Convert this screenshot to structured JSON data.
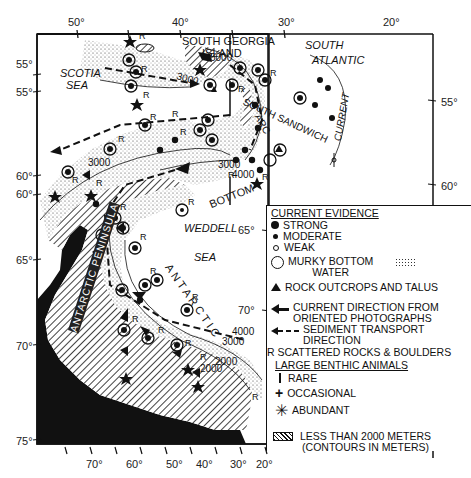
{
  "map": {
    "top_longitudes": [
      "50°",
      "40°",
      "30°",
      "20°"
    ],
    "bottom_longitudes": [
      "70°",
      "60°",
      "50°",
      "40°",
      "30°",
      "20°"
    ],
    "left_latitudes": [
      "55°",
      "55°",
      "60°",
      "60°",
      "65°",
      "70°",
      "75°"
    ],
    "right_latitudes": [
      "55°",
      "60°"
    ],
    "inner_latitudes": [
      "65°",
      "70°"
    ],
    "place_labels": {
      "south_georgia": "SOUTH GEORGIA",
      "island": "ISLAND",
      "south": "SOUTH",
      "atlantic": "ATLANTIC",
      "scotia": "SCOTIA",
      "sea": "SEA",
      "south_sandwich": "SOUTH SANDWICH",
      "arc": "ARC",
      "current": "CURRENT",
      "weddell": "WEDDELL",
      "weddell_sea": "SEA",
      "bottom": "BOTTOM",
      "antarctic": "ANTARCTIC",
      "antarctic_peninsula": "ANTARCTIC PENINSULA"
    },
    "contours": [
      "5000",
      "3000",
      "3000",
      "4000",
      "3000",
      "4000",
      "3000",
      "2000",
      "2000"
    ],
    "rock_marker": "R"
  },
  "legend": {
    "current_evidence_title": "CURRENT EVIDENCE",
    "strong": "STRONG",
    "moderate": "MODERATE",
    "weak": "WEAK",
    "murky_1": "MURKY BOTTOM",
    "murky_2": "WATER",
    "rock_outcrops": "ROCK OUTCROPS AND TALUS",
    "current_dir_1": "CURRENT DIRECTION FROM",
    "current_dir_2": "ORIENTED PHOTOGRAPHS",
    "sediment_1": "SEDIMENT  TRANSPORT",
    "sediment_2": "DIRECTION",
    "scattered": "R SCATTERED ROCKS & BOULDERS",
    "benthic_title": "LARGE BENTHIC ANIMALS",
    "rare": "RARE",
    "occasional": "OCCASIONAL",
    "abundant": "ABUNDANT",
    "depth_1": "LESS THAN 2000 METERS",
    "depth_2": "(CONTOURS IN METERS)"
  }
}
